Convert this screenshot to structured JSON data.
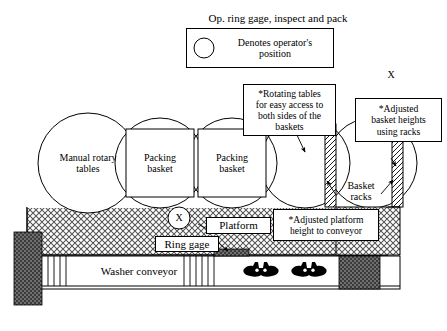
{
  "figure": {
    "title": "Op. ring gage, inspect and pack",
    "domain_kind": "process-layout-diagram"
  },
  "legend": {
    "marker": "X",
    "text": "Denotes operator's\nposition"
  },
  "callouts": [
    {
      "id": "rotating-tables",
      "text": "*Rotating tables\nfor easy access to\nboth sides of the\nbaskets"
    },
    {
      "id": "adjusted-basket-heights",
      "text": "*Adjusted\nbasket heights\nusing racks"
    },
    {
      "id": "adjusted-platform-height",
      "text": "*Adjusted platform\nheight to conveyor"
    }
  ],
  "stations": [
    {
      "id": "manual-rotary-tables",
      "label": "Manual rotary\ntables",
      "shape": "circle"
    },
    {
      "id": "packing-basket-1",
      "label": "Packing\nbasket",
      "shape": "square-in-circle"
    },
    {
      "id": "packing-basket-2",
      "label": "Packing\nbasket",
      "shape": "square-in-circle"
    }
  ],
  "labels": {
    "platform": "Platform",
    "ring_gage": "Ring gage",
    "washer_conveyor": "Washer conveyor",
    "basket_racks": "Basket\nracks",
    "operator_marker": "X"
  },
  "colors": {
    "stroke": "#000000",
    "background": "#ffffff",
    "platform_hatch": "#5a5a5a",
    "dark_block": "#4a4a4a",
    "part_silhouette": "#000000"
  }
}
